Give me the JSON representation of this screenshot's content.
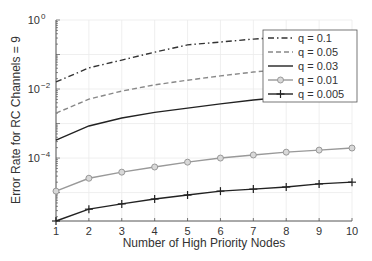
{
  "chart_data": {
    "type": "line",
    "title": "",
    "xlabel": "Number of High Priority Nodes",
    "ylabel": "Error Rate for RC Channels = 9",
    "yscale": "log",
    "xlim": [
      1,
      10
    ],
    "ylim": [
      1.5e-06,
      1
    ],
    "grid": true,
    "legend_position": "upper right (inside)",
    "x": [
      1,
      2,
      3,
      4,
      5,
      6,
      7,
      8,
      9,
      10
    ],
    "x_ticks": [
      "1",
      "2",
      "3",
      "4",
      "5",
      "6",
      "7",
      "8",
      "9",
      "10"
    ],
    "y_ticks": [
      {
        "value": 1,
        "label_base": "10",
        "label_exp": "0"
      },
      {
        "value": 0.01,
        "label_base": "10",
        "label_exp": "−2"
      },
      {
        "value": 0.0001,
        "label_base": "10",
        "label_exp": "−4"
      }
    ],
    "series": [
      {
        "name": "q = 0.1",
        "style": "dash-dot",
        "color": "#333333",
        "marker": "none",
        "values": [
          0.016,
          0.041,
          0.069,
          0.117,
          0.19,
          0.23,
          0.28,
          0.32,
          0.35,
          0.37
        ]
      },
      {
        "name": "q = 0.05",
        "style": "dashed",
        "color": "#888888",
        "marker": "none",
        "values": [
          0.002,
          0.0051,
          0.0087,
          0.0132,
          0.018,
          0.024,
          0.031,
          0.038,
          0.044,
          0.05
        ]
      },
      {
        "name": "q = 0.03",
        "style": "solid",
        "color": "#222222",
        "marker": "none",
        "values": [
          0.00033,
          0.00085,
          0.00145,
          0.0021,
          0.0028,
          0.0037,
          0.0048,
          0.0059,
          0.0072,
          0.0087
        ]
      },
      {
        "name": "q = 0.01",
        "style": "solid",
        "color": "#999999",
        "marker": "circle",
        "values": [
          1.1e-05,
          2.6e-05,
          3.9e-05,
          5.5e-05,
          7.6e-05,
          0.0001,
          0.000123,
          0.000148,
          0.00017,
          0.000195
        ]
      },
      {
        "name": "q = 0.005",
        "style": "solid",
        "color": "#222222",
        "marker": "plus",
        "values": [
          1.5e-06,
          3.3e-06,
          4.7e-06,
          6.5e-06,
          8.5e-06,
          1.1e-05,
          1.26e-05,
          1.45e-05,
          1.78e-05,
          2e-05
        ]
      }
    ]
  }
}
